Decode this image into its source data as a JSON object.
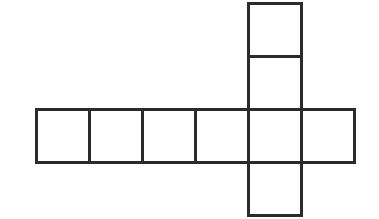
{
  "canvas": {
    "width": 379,
    "height": 219,
    "background_color": "#ffffff"
  },
  "figure": {
    "name": "cube-net-polyomino",
    "stroke_color": "#2b2b2b",
    "fill_color": "#ffffff",
    "stroke_width": 3,
    "cell_size": 53,
    "origin": {
      "x": 36,
      "y": 3
    },
    "total_squares": 8,
    "grid_columns": 6,
    "grid_rows": 4
  },
  "chart_data": {
    "type": "table",
    "title": "",
    "xlabel": "",
    "ylabel": "",
    "grid": true,
    "legend": "none",
    "cell_size": 53,
    "origin_x": 36,
    "origin_y": 3,
    "occupied_cells": [
      {
        "col": 4,
        "row": 0
      },
      {
        "col": 4,
        "row": 1
      },
      {
        "col": 0,
        "row": 2
      },
      {
        "col": 1,
        "row": 2
      },
      {
        "col": 2,
        "row": 2
      },
      {
        "col": 3,
        "row": 2
      },
      {
        "col": 4,
        "row": 2
      },
      {
        "col": 5,
        "row": 2
      },
      {
        "col": 4,
        "row": 3
      }
    ],
    "row_strip_count": 6,
    "column_strip_count": 4
  }
}
